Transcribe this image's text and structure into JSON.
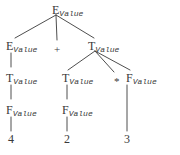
{
  "figure": {
    "kind": "parse-tree",
    "caption": "",
    "ink_color": "#3a3a3a",
    "background_color": "#ffffff",
    "width": 180,
    "height": 155
  },
  "nodes": {
    "root_e": {
      "symbol": "E",
      "attribute": "Value",
      "x": 52,
      "y": 4
    },
    "left_e": {
      "symbol": "E",
      "attribute": "Value",
      "x": 6,
      "y": 40
    },
    "left_t": {
      "symbol": "T",
      "attribute": "Value",
      "x": 6,
      "y": 72
    },
    "left_f": {
      "symbol": "F",
      "attribute": "Value",
      "x": 6,
      "y": 104
    },
    "right_t": {
      "symbol": "T",
      "attribute": "Value",
      "x": 88,
      "y": 40
    },
    "mid_t": {
      "symbol": "T",
      "attribute": "Value",
      "x": 62,
      "y": 72
    },
    "mid_f": {
      "symbol": "F",
      "attribute": "Value",
      "x": 62,
      "y": 104
    },
    "right_f": {
      "symbol": "F",
      "attribute": "Value",
      "x": 126,
      "y": 72
    }
  },
  "terminals": {
    "plus": {
      "label": "+",
      "x": 54,
      "y": 44
    },
    "star": {
      "label": "*",
      "x": 114,
      "y": 76
    }
  },
  "leaves": {
    "four": {
      "label": "4",
      "x": 11,
      "y": 136
    },
    "two": {
      "label": "2",
      "x": 67,
      "y": 136
    },
    "three": {
      "label": "3",
      "x": 124,
      "y": 136
    }
  },
  "expression": {
    "terminals_in_order": [
      "4",
      "+",
      "2",
      "*",
      "3"
    ],
    "attribute_name": "Value"
  }
}
